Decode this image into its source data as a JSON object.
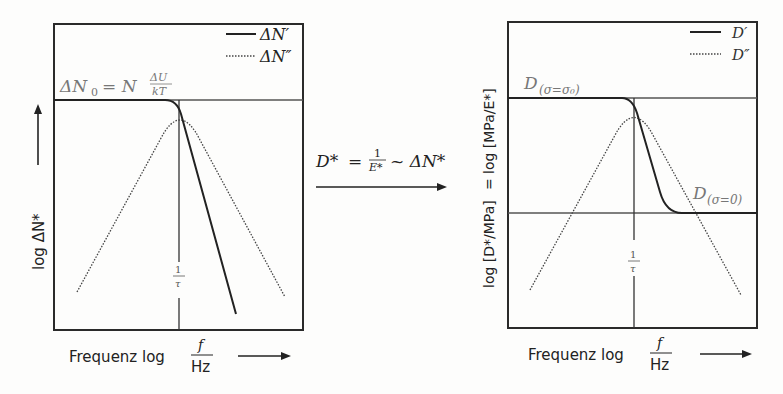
{
  "left_panel": {
    "y_label": "log ΔN*",
    "x_label_prefix": "Frequenz log",
    "x_label_num": "f",
    "x_label_den": "Hz",
    "level_label_main": "ΔN",
    "level_label_sub": "0",
    "level_label_eq": "= N",
    "level_label_frac_num": "ΔU",
    "level_label_frac_den": "kT",
    "tau_num": "1",
    "tau_den": "τ",
    "legend": [
      {
        "style": "solid",
        "label": "ΔN′"
      },
      {
        "style": "dotted",
        "label": "ΔN″"
      }
    ]
  },
  "arrow": {
    "lhs": "D*",
    "eq": "=",
    "frac_num": "1",
    "frac_den": "E*",
    "rhs": "~ ΔN*"
  },
  "right_panel": {
    "y_label_left": "log [D*/MPa]",
    "y_label_eq": "=",
    "y_label_right": "log [MPa/E*]",
    "x_label_prefix": "Frequenz log",
    "x_label_num": "f",
    "x_label_den": "Hz",
    "upper_level_label": "D",
    "upper_level_sub": "(σ=σ₀)",
    "lower_level_label": "D",
    "lower_level_sub": "(σ=0)",
    "tau_num": "1",
    "tau_den": "τ",
    "legend": [
      {
        "style": "solid",
        "label": "D′"
      },
      {
        "style": "dotted",
        "label": "D″"
      }
    ]
  },
  "colors": {
    "line": "#2a2a2a",
    "grey_text": "#777777",
    "background": "#fdfdfc"
  }
}
